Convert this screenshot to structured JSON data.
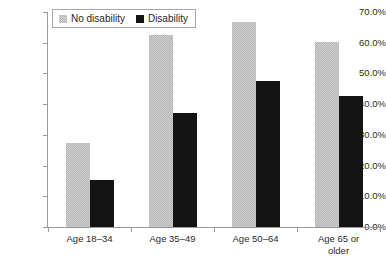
{
  "chart_data": {
    "type": "bar",
    "title": "",
    "subtitle": "",
    "xlabel": "",
    "ylabel": "",
    "categories": [
      "Age 18–34",
      "Age 35–49",
      "Age 50–64",
      "Age 65 or older"
    ],
    "category_lines": [
      [
        "Age 18–34"
      ],
      [
        "Age 35–49"
      ],
      [
        "Age 50–64"
      ],
      [
        "Age 65 or",
        "older"
      ]
    ],
    "series": [
      {
        "name": "No disability",
        "color": "#b4b4b4",
        "values": [
          27.4,
          62.5,
          66.8,
          60.3
        ]
      },
      {
        "name": "Disability",
        "color": "#141414",
        "values": [
          15.3,
          37.1,
          47.6,
          42.7
        ]
      }
    ],
    "ylim": [
      0,
      70
    ],
    "ytick_values": [
      0,
      10,
      20,
      30,
      40,
      50,
      60,
      70
    ],
    "ytick_labels": [
      "0.0%",
      "10.0%",
      "20.0%",
      "30.0%",
      "40.0%",
      "50.0%",
      "60.0%",
      "70.0%"
    ],
    "grid": false,
    "legend_position": "top-left-inside",
    "value_suffix": "%"
  },
  "legend": {
    "items": [
      {
        "label": "No disability",
        "swatch": "series-a"
      },
      {
        "label": "Disability",
        "swatch": "series-b"
      }
    ]
  }
}
